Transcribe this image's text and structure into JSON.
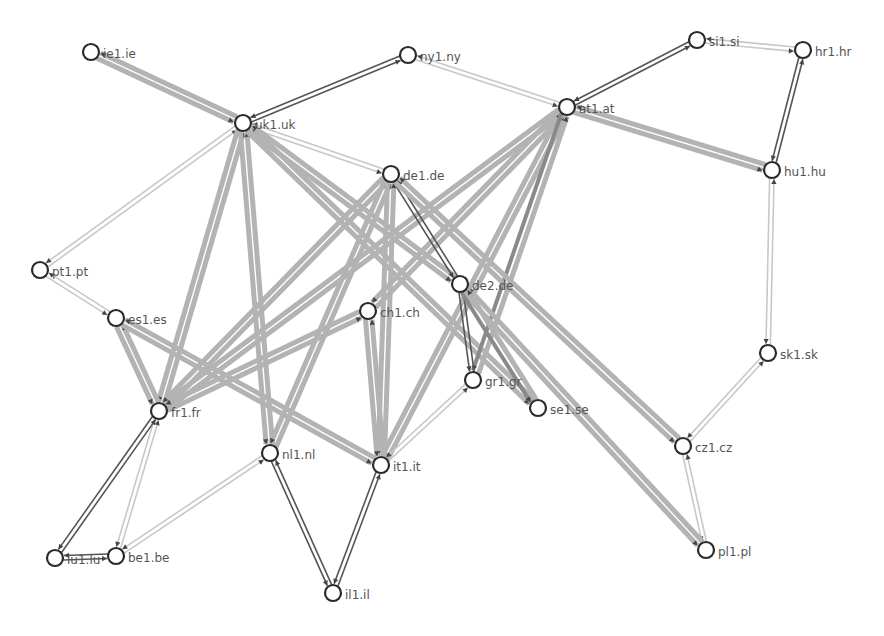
{
  "diagram": {
    "type": "network-topology",
    "colors": {
      "background": "#ffffff",
      "node_stroke": "#2a2a2a",
      "node_fill": "#ffffff",
      "label": "#555555",
      "edge_heavy": "#b3b3b3",
      "edge_light": "#c8c8c8",
      "edge_dark": "#555555"
    },
    "nodes": [
      {
        "id": "ie1",
        "label": "ie1.ie",
        "x": 91,
        "y": 52
      },
      {
        "id": "ny1",
        "label": "ny1.ny",
        "x": 408,
        "y": 55
      },
      {
        "id": "uk1",
        "label": "uk1.uk",
        "x": 243,
        "y": 123
      },
      {
        "id": "de1",
        "label": "de1.de",
        "x": 391,
        "y": 174
      },
      {
        "id": "at1",
        "label": "at1.at",
        "x": 567,
        "y": 107
      },
      {
        "id": "si1",
        "label": "si1.si",
        "x": 697,
        "y": 40
      },
      {
        "id": "hr1",
        "label": "hr1.hr",
        "x": 803,
        "y": 50
      },
      {
        "id": "hu1",
        "label": "hu1.hu",
        "x": 772,
        "y": 170
      },
      {
        "id": "pt1",
        "label": "pt1.pt",
        "x": 40,
        "y": 270
      },
      {
        "id": "es1",
        "label": "es1.es",
        "x": 116,
        "y": 318
      },
      {
        "id": "ch1",
        "label": "ch1.ch",
        "x": 368,
        "y": 311
      },
      {
        "id": "de2",
        "label": "de2.de",
        "x": 460,
        "y": 284
      },
      {
        "id": "gr1",
        "label": "gr1.gr",
        "x": 473,
        "y": 380
      },
      {
        "id": "se1",
        "label": "se1.se",
        "x": 538,
        "y": 408
      },
      {
        "id": "fr1",
        "label": "fr1.fr",
        "x": 159,
        "y": 411
      },
      {
        "id": "nl1",
        "label": "nl1.nl",
        "x": 270,
        "y": 453
      },
      {
        "id": "it1",
        "label": "it1.it",
        "x": 381,
        "y": 465
      },
      {
        "id": "cz1",
        "label": "cz1.cz",
        "x": 683,
        "y": 446
      },
      {
        "id": "sk1",
        "label": "sk1.sk",
        "x": 768,
        "y": 353
      },
      {
        "id": "lu1",
        "label": "lu1.lu",
        "x": 55,
        "y": 558
      },
      {
        "id": "be1",
        "label": "be1.be",
        "x": 116,
        "y": 556
      },
      {
        "id": "il1",
        "label": "il1.il",
        "x": 333,
        "y": 593
      },
      {
        "id": "pl1",
        "label": "pl1.pl",
        "x": 706,
        "y": 550
      }
    ],
    "edges": [
      {
        "a": "ie1",
        "b": "uk1",
        "weight": "heavy"
      },
      {
        "a": "uk1",
        "b": "ny1",
        "weight": "dark"
      },
      {
        "a": "uk1",
        "b": "de1",
        "weight": "light"
      },
      {
        "a": "uk1",
        "b": "pt1",
        "weight": "light"
      },
      {
        "a": "uk1",
        "b": "fr1",
        "weight": "heavy"
      },
      {
        "a": "uk1",
        "b": "nl1",
        "weight": "heavy"
      },
      {
        "a": "uk1",
        "b": "se1",
        "weight": "heavy"
      },
      {
        "a": "uk1",
        "b": "de2",
        "weight": "heavy"
      },
      {
        "a": "ny1",
        "b": "at1",
        "weight": "light"
      },
      {
        "a": "at1",
        "b": "si1",
        "weight": "dark"
      },
      {
        "a": "at1",
        "b": "hu1",
        "weight": "heavy"
      },
      {
        "a": "at1",
        "b": "ch1",
        "weight": "heavy"
      },
      {
        "a": "at1",
        "b": "it1",
        "weight": "heavy"
      },
      {
        "a": "at1",
        "b": "fr1",
        "weight": "heavy"
      },
      {
        "a": "at1",
        "b": "gr1",
        "weight": "darkheavy"
      },
      {
        "a": "si1",
        "b": "hr1",
        "weight": "light"
      },
      {
        "a": "hr1",
        "b": "hu1",
        "weight": "dark"
      },
      {
        "a": "hu1",
        "b": "sk1",
        "weight": "light"
      },
      {
        "a": "sk1",
        "b": "cz1",
        "weight": "light"
      },
      {
        "a": "cz1",
        "b": "pl1",
        "weight": "light"
      },
      {
        "a": "de1",
        "b": "de2",
        "weight": "dark"
      },
      {
        "a": "de1",
        "b": "fr1",
        "weight": "heavy"
      },
      {
        "a": "de1",
        "b": "nl1",
        "weight": "heavy"
      },
      {
        "a": "de1",
        "b": "it1",
        "weight": "heavy"
      },
      {
        "a": "de1",
        "b": "cz1",
        "weight": "heavy"
      },
      {
        "a": "de2",
        "b": "gr1",
        "weight": "dark"
      },
      {
        "a": "de2",
        "b": "pl1",
        "weight": "heavy"
      },
      {
        "a": "de2",
        "b": "se1",
        "weight": "darkheavy"
      },
      {
        "a": "pt1",
        "b": "es1",
        "weight": "light"
      },
      {
        "a": "es1",
        "b": "fr1",
        "weight": "heavy"
      },
      {
        "a": "es1",
        "b": "it1",
        "weight": "heavy"
      },
      {
        "a": "ch1",
        "b": "fr1",
        "weight": "heavy"
      },
      {
        "a": "ch1",
        "b": "it1",
        "weight": "heavy"
      },
      {
        "a": "it1",
        "b": "gr1",
        "weight": "light"
      },
      {
        "a": "it1",
        "b": "il1",
        "weight": "dark"
      },
      {
        "a": "nl1",
        "b": "il1",
        "weight": "dark"
      },
      {
        "a": "nl1",
        "b": "be1",
        "weight": "light"
      },
      {
        "a": "fr1",
        "b": "be1",
        "weight": "light"
      },
      {
        "a": "fr1",
        "b": "lu1",
        "weight": "dark"
      },
      {
        "a": "lu1",
        "b": "be1",
        "weight": "dark"
      }
    ]
  }
}
